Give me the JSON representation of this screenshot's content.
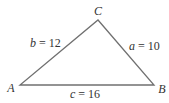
{
  "diagram": {
    "type": "triangle",
    "stroke_color": "#666666",
    "vertices": {
      "A": {
        "label": "A",
        "x": 20,
        "y": 85
      },
      "B": {
        "label": "B",
        "x": 154,
        "y": 85
      },
      "C": {
        "label": "C",
        "x": 98,
        "y": 20
      }
    },
    "sides": {
      "a": {
        "var": "a",
        "eq": " = ",
        "value": "10"
      },
      "b": {
        "var": "b",
        "eq": " = ",
        "value": "12"
      },
      "c": {
        "var": "c",
        "eq": " = ",
        "value": "16"
      }
    }
  }
}
